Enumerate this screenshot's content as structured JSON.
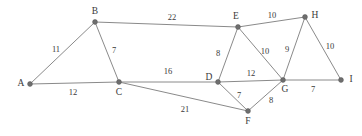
{
  "graph": {
    "type": "undirected-weighted-graph",
    "width": 362,
    "height": 136,
    "background_color": "#ffffff",
    "edge_color": "#8a8a8a",
    "node_color": "#6e6e6e",
    "label_color": "#3a3a3a",
    "nodes": [
      {
        "id": "A",
        "label": "A",
        "x": 30,
        "y": 84,
        "label_x": 21,
        "label_y": 84
      },
      {
        "id": "B",
        "label": "B",
        "x": 95,
        "y": 22,
        "label_x": 95,
        "label_y": 12
      },
      {
        "id": "C",
        "label": "C",
        "x": 119,
        "y": 82,
        "label_x": 119,
        "label_y": 93
      },
      {
        "id": "D",
        "label": "D",
        "x": 218,
        "y": 82,
        "label_x": 209,
        "label_y": 78
      },
      {
        "id": "E",
        "label": "E",
        "x": 238,
        "y": 27,
        "label_x": 236,
        "label_y": 17
      },
      {
        "id": "F",
        "label": "F",
        "x": 248,
        "y": 111,
        "label_x": 248,
        "label_y": 122
      },
      {
        "id": "G",
        "label": "G",
        "x": 283,
        "y": 80,
        "label_x": 285,
        "label_y": 90
      },
      {
        "id": "H",
        "label": "H",
        "x": 305,
        "y": 17,
        "label_x": 315,
        "label_y": 16
      },
      {
        "id": "I",
        "label": "I",
        "x": 341,
        "y": 80,
        "label_x": 351,
        "label_y": 80
      }
    ],
    "edges": [
      {
        "from": "A",
        "to": "B",
        "weight": "11",
        "label_x": 56,
        "label_y": 50
      },
      {
        "from": "A",
        "to": "C",
        "weight": "12",
        "label_x": 73,
        "label_y": 93
      },
      {
        "from": "B",
        "to": "C",
        "weight": "7",
        "label_x": 114,
        "label_y": 51
      },
      {
        "from": "B",
        "to": "E",
        "weight": "22",
        "label_x": 172,
        "label_y": 18
      },
      {
        "from": "C",
        "to": "D",
        "weight": "16",
        "label_x": 168,
        "label_y": 72
      },
      {
        "from": "C",
        "to": "F",
        "weight": "21",
        "label_x": 185,
        "label_y": 110
      },
      {
        "from": "D",
        "to": "E",
        "weight": "8",
        "label_x": 218,
        "label_y": 54
      },
      {
        "from": "D",
        "to": "G",
        "weight": "12",
        "label_x": 251,
        "label_y": 74
      },
      {
        "from": "D",
        "to": "F",
        "weight": "7",
        "label_x": 239,
        "label_y": 96
      },
      {
        "from": "E",
        "to": "G",
        "weight": "10",
        "label_x": 265,
        "label_y": 52
      },
      {
        "from": "E",
        "to": "H",
        "weight": "10",
        "label_x": 272,
        "label_y": 16
      },
      {
        "from": "F",
        "to": "G",
        "weight": "8",
        "label_x": 271,
        "label_y": 101
      },
      {
        "from": "G",
        "to": "H",
        "weight": "9",
        "label_x": 287,
        "label_y": 50
      },
      {
        "from": "G",
        "to": "I",
        "weight": "7",
        "label_x": 313,
        "label_y": 90
      },
      {
        "from": "H",
        "to": "I",
        "weight": "10",
        "label_x": 330,
        "label_y": 47
      }
    ]
  }
}
